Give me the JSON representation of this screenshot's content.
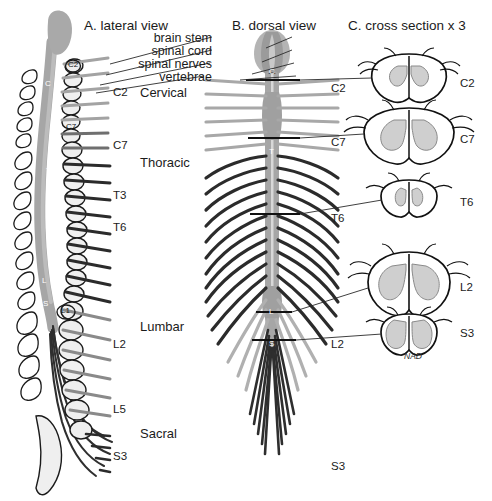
{
  "figure": {
    "width": 492,
    "height": 501,
    "background": "#ffffff"
  },
  "panels": [
    {
      "id": "lateral",
      "title": "A. lateral view",
      "x": 84,
      "y": 26
    },
    {
      "id": "dorsal",
      "title": "B. dorsal view",
      "x": 232,
      "y": 26
    },
    {
      "id": "cross",
      "title": "C. cross section x 3",
      "x": 348,
      "y": 26
    }
  ],
  "callouts": [
    {
      "id": "brain-stem",
      "text": "brain stem",
      "x": 215,
      "y": 40
    },
    {
      "id": "spinal-cord",
      "text": "spinal cord",
      "x": 215,
      "y": 53
    },
    {
      "id": "spinal-nerves",
      "text": "spinal nerves",
      "x": 215,
      "y": 66
    },
    {
      "id": "vertebrae",
      "text": "vertebrae",
      "x": 215,
      "y": 79
    }
  ],
  "lateral_labels": {
    "segments": [
      {
        "text": "C2",
        "x": 113,
        "y": 93
      },
      {
        "text": "C7",
        "x": 113,
        "y": 146
      },
      {
        "text": "T3",
        "x": 113,
        "y": 196
      },
      {
        "text": "T6",
        "x": 113,
        "y": 228
      },
      {
        "text": "L2",
        "x": 113,
        "y": 345
      },
      {
        "text": "L5",
        "x": 113,
        "y": 410
      },
      {
        "text": "S3",
        "x": 113,
        "y": 457
      }
    ],
    "regions": [
      {
        "text": "Cervical",
        "x": 140,
        "y": 93
      },
      {
        "text": "Thoracic",
        "x": 140,
        "y": 163
      },
      {
        "text": "Lumbar",
        "x": 140,
        "y": 327
      },
      {
        "text": "Sacral",
        "x": 140,
        "y": 434
      }
    ],
    "vertebra_marks": [
      {
        "text": "C2",
        "x": 73,
        "y": 67
      },
      {
        "text": "C7",
        "x": 72,
        "y": 128
      },
      {
        "text": "L1",
        "x": 66,
        "y": 312
      }
    ],
    "cord_marks": [
      {
        "text": "C",
        "x": 47,
        "y": 85
      },
      {
        "text": "T",
        "x": 48,
        "y": 172
      },
      {
        "text": "L",
        "x": 44,
        "y": 282
      },
      {
        "text": "S",
        "x": 45,
        "y": 305
      }
    ]
  },
  "dorsal_labels": {
    "segments": [
      {
        "text": "C2",
        "x": 331,
        "y": 89
      },
      {
        "text": "C7",
        "x": 331,
        "y": 143
      },
      {
        "text": "T6",
        "x": 331,
        "y": 219
      },
      {
        "text": "L2",
        "x": 331,
        "y": 345
      },
      {
        "text": "S3",
        "x": 331,
        "y": 467
      }
    ],
    "cord_marks": [
      {
        "text": "C",
        "x": 283,
        "y": 72
      },
      {
        "text": "T",
        "x": 280,
        "y": 152
      },
      {
        "text": "L",
        "x": 281,
        "y": 313
      },
      {
        "text": "S",
        "x": 281,
        "y": 345
      }
    ]
  },
  "cross_sections": [
    {
      "id": "c2",
      "label": "C2",
      "label_x": 460,
      "label_y": 84,
      "cx": 409,
      "cy": 80,
      "rx": 41,
      "ry": 26,
      "shape": "cervical-upper"
    },
    {
      "id": "c7",
      "label": "C7",
      "label_x": 460,
      "label_y": 140,
      "cx": 409,
      "cy": 136,
      "rx": 47,
      "ry": 29,
      "shape": "cervical-lower"
    },
    {
      "id": "t6",
      "label": "T6",
      "label_x": 460,
      "label_y": 203,
      "cx": 409,
      "cy": 200,
      "rx": 30,
      "ry": 20,
      "shape": "thoracic"
    },
    {
      "id": "l2",
      "label": "L2",
      "label_x": 460,
      "label_y": 288,
      "cx": 409,
      "cy": 284,
      "rx": 42,
      "ry": 33,
      "shape": "lumbar"
    },
    {
      "id": "s3",
      "label": "S3",
      "label_x": 460,
      "label_y": 334,
      "cx": 409,
      "cy": 334,
      "rx": 30,
      "ry": 22,
      "shape": "sacral"
    }
  ],
  "signature": {
    "text": "NAD",
    "x": 404,
    "y": 357
  },
  "leader_lines": {
    "callouts_left": [
      {
        "x1": 212,
        "y1": 37,
        "x2": 110,
        "y2": 64
      },
      {
        "x1": 212,
        "y1": 50,
        "x2": 108,
        "y2": 74
      },
      {
        "x1": 212,
        "y1": 63,
        "x2": 104,
        "y2": 84
      },
      {
        "x1": 212,
        "y1": 76,
        "x2": 102,
        "y2": 92
      }
    ],
    "callouts_right": [
      {
        "x1": 290,
        "y1": 37,
        "x2": 268,
        "y2": 50
      },
      {
        "x1": 290,
        "y1": 50,
        "x2": 266,
        "y2": 62
      },
      {
        "x1": 292,
        "y1": 63,
        "x2": 262,
        "y2": 74
      },
      {
        "x1": 294,
        "y1": 76,
        "x2": 242,
        "y2": 80
      }
    ],
    "cross_links": [
      {
        "x1": 348,
        "y1": 89,
        "x2": 370,
        "y2": 80,
        "from": "C2"
      },
      {
        "x1": 348,
        "y1": 143,
        "x2": 366,
        "y2": 136,
        "from": "C7"
      },
      {
        "x1": 348,
        "y1": 219,
        "x2": 380,
        "y2": 200,
        "from": "T6"
      },
      {
        "x1": 348,
        "y1": 345,
        "x2": 368,
        "y2": 290,
        "from": "L2"
      },
      {
        "x1": 348,
        "y1": 345,
        "x2": 380,
        "y2": 335,
        "from": "S3"
      }
    ]
  },
  "colors": {
    "ink": "#1b1b1b",
    "cord_gray": "#a6a6a6",
    "cord_gray_dark": "#8e8e8e",
    "gray_matter": "#cfcfcf",
    "nerve_light": "#a8a8a8",
    "nerve_mid": "#6e6e6e",
    "nerve_dark": "#2a2a2a",
    "bone_fill": "#efefef",
    "bone_stroke": "#1b1b1b",
    "background": "#ffffff"
  }
}
